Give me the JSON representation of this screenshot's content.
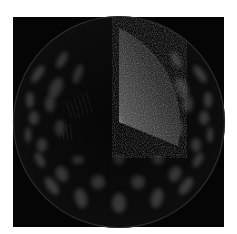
{
  "image": {
    "description": "Rendered sphere with grid of bright elliptical blobs and a noisy wedge cut-out",
    "background_color": "#ffffff",
    "frame_color": "#050505",
    "sphere": {
      "cx": 119,
      "cy": 122,
      "r": 106,
      "fill": "#0c0c0c",
      "rim": "#3a3a3a"
    },
    "blob_color": "#4a4a4a",
    "wedge": {
      "fill": "#262626",
      "highlight": "#d8d8d8"
    }
  }
}
